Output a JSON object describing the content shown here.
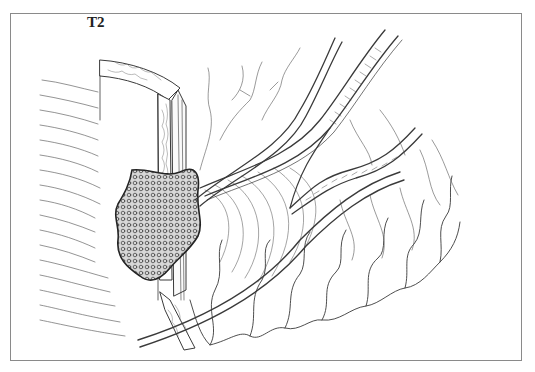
{
  "figure": {
    "label": "T2",
    "colors": {
      "line": "#3a3a3a",
      "frame": "#8a8a8a",
      "background": "#ffffff"
    }
  }
}
